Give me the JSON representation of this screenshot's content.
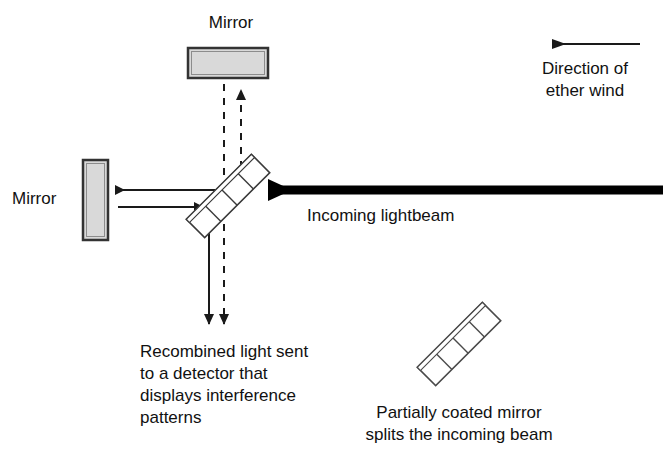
{
  "figure": {
    "background_color": "#ffffff",
    "line_color": "#1a1a1a",
    "mirror_fill": "#d9d9d9",
    "mirror_stroke": "#3a3a3a",
    "beam_color": "#000000"
  },
  "labels": {
    "top_mirror": "Mirror",
    "left_mirror": "Mirror",
    "ether_wind_line1": "Direction of",
    "ether_wind_line2": "ether wind",
    "incoming_beam": "Incoming lightbeam",
    "detector_line1": "Recombined light sent",
    "detector_line2": "to a detector that",
    "detector_line3": "displays interference",
    "detector_line4": "patterns",
    "splitter_line1": "Partially coated mirror",
    "splitter_line2": "splits the incoming beam"
  },
  "components": {
    "top_mirror": {
      "name": "top-mirror",
      "x": 188,
      "y": 48,
      "width": 80,
      "height": 30,
      "orientation": "horizontal"
    },
    "left_mirror": {
      "name": "left-mirror",
      "x": 83,
      "y": 160,
      "width": 25,
      "height": 80,
      "orientation": "vertical"
    },
    "beam_splitter": {
      "name": "beam-splitter",
      "center_x": 228,
      "center_y": 196,
      "length": 92,
      "thickness": 26,
      "rotation_deg": -45,
      "segments": 4
    },
    "legend_mirror": {
      "name": "legend-partially-coated-mirror",
      "center_x": 459,
      "center_y": 344,
      "length": 92,
      "thickness": 26,
      "rotation_deg": -45,
      "segments": 4
    }
  },
  "beams": {
    "incoming": {
      "name": "incoming-lightbeam",
      "type": "thick-solid",
      "from_x": 663,
      "to_x": 245,
      "y": 190,
      "arrow": "left",
      "width_px": 9
    },
    "to_left_mirror": {
      "name": "beam-to-left-mirror",
      "type": "thin-solid",
      "from_x": 228,
      "to_x": 110,
      "y": 190,
      "arrow": "left"
    },
    "from_left_mirror": {
      "name": "beam-from-left-mirror",
      "type": "thin-solid",
      "from_x": 110,
      "to_x": 209,
      "y": 207,
      "arrow": "right"
    },
    "to_top_mirror": {
      "name": "beam-to-top-mirror",
      "type": "dashed",
      "x": 241,
      "from_y": 196,
      "to_y": 84,
      "arrow": "up"
    },
    "from_top_mirror": {
      "name": "beam-from-top-mirror",
      "type": "dashed",
      "x": 224,
      "from_y": 84,
      "to_y": 196,
      "arrow": "none"
    },
    "output_solid": {
      "name": "output-beam-solid",
      "x": 209,
      "from_y": 207,
      "to_y": 330,
      "arrow": "down",
      "type": "thin-solid"
    },
    "output_dashed": {
      "name": "output-beam-dashed",
      "x": 224,
      "from_y": 196,
      "to_y": 330,
      "arrow": "down",
      "type": "dashed"
    },
    "ether_wind": {
      "name": "ether-wind-arrow",
      "type": "thin-solid",
      "from_x": 640,
      "to_x": 543,
      "y": 44,
      "arrow": "left"
    }
  },
  "label_positions": {
    "top_mirror": {
      "x": 196,
      "y": 14
    },
    "left_mirror": {
      "x": 12,
      "y": 189
    },
    "ether_wind": {
      "x": 520,
      "y": 60
    },
    "incoming": {
      "x": 307,
      "y": 205
    },
    "detector": {
      "x": 140,
      "y": 342
    },
    "splitter": {
      "x": 378,
      "y": 403
    }
  }
}
